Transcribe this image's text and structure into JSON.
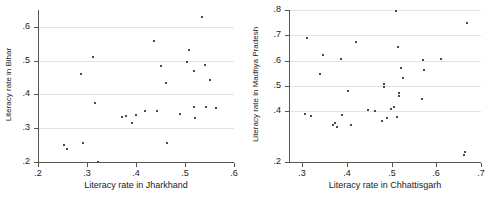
{
  "chart_data": [
    {
      "id": "left",
      "type": "scatter",
      "title": "",
      "xlabel": "Literacy rate in Jharkhand",
      "ylabel": "Literacy rate in Bihar",
      "xlim": [
        0.2,
        0.6
      ],
      "ylim": [
        0.2,
        0.65
      ],
      "xticks": [
        0.2,
        0.3,
        0.4,
        0.5,
        0.6
      ],
      "xticklabels": [
        ".2",
        ".3",
        ".4",
        ".5",
        ".6"
      ],
      "yticks": [
        0.2,
        0.3,
        0.4,
        0.5,
        0.6
      ],
      "yticklabels": [
        ".2",
        ".3",
        ".4",
        ".5",
        ".6"
      ],
      "gridlines": [
        0.2,
        0.3,
        0.4,
        0.5,
        0.6
      ],
      "grid": true,
      "legend": "none",
      "marker": "square",
      "marker_color": "#4a4a4a",
      "points": [
        {
          "x": 0.253,
          "y": 0.25
        },
        {
          "x": 0.26,
          "y": 0.239
        },
        {
          "x": 0.287,
          "y": 0.462
        },
        {
          "x": 0.291,
          "y": 0.255
        },
        {
          "x": 0.312,
          "y": 0.511
        },
        {
          "x": 0.316,
          "y": 0.374
        },
        {
          "x": 0.322,
          "y": 0.2
        },
        {
          "x": 0.371,
          "y": 0.333
        },
        {
          "x": 0.379,
          "y": 0.336
        },
        {
          "x": 0.392,
          "y": 0.316
        },
        {
          "x": 0.401,
          "y": 0.338
        },
        {
          "x": 0.418,
          "y": 0.35
        },
        {
          "x": 0.437,
          "y": 0.559
        },
        {
          "x": 0.443,
          "y": 0.35
        },
        {
          "x": 0.452,
          "y": 0.485
        },
        {
          "x": 0.461,
          "y": 0.433
        },
        {
          "x": 0.464,
          "y": 0.257
        },
        {
          "x": 0.49,
          "y": 0.342
        },
        {
          "x": 0.505,
          "y": 0.496
        },
        {
          "x": 0.509,
          "y": 0.531
        },
        {
          "x": 0.518,
          "y": 0.468
        },
        {
          "x": 0.519,
          "y": 0.364
        },
        {
          "x": 0.521,
          "y": 0.329
        },
        {
          "x": 0.534,
          "y": 0.628
        },
        {
          "x": 0.541,
          "y": 0.486
        },
        {
          "x": 0.543,
          "y": 0.364
        },
        {
          "x": 0.551,
          "y": 0.442
        },
        {
          "x": 0.563,
          "y": 0.36
        }
      ]
    },
    {
      "id": "right",
      "type": "scatter",
      "title": "",
      "xlabel": "Literacy rate in Chhattisgarh",
      "ylabel": "Literacy rate in Madhya Pradesh",
      "xlim": [
        0.27,
        0.7
      ],
      "ylim": [
        0.2,
        0.8
      ],
      "xticks": [
        0.3,
        0.4,
        0.5,
        0.6,
        0.7
      ],
      "xticklabels": [
        ".3",
        ".4",
        ".5",
        ".6",
        ".7"
      ],
      "yticks": [
        0.2,
        0.4,
        0.5,
        0.6,
        0.7,
        0.8
      ],
      "yticklabels": [
        ".2",
        ".4",
        ".5",
        ".6",
        ".7",
        ".8"
      ],
      "gridlines": [
        0.2,
        0.4,
        0.5,
        0.6,
        0.7,
        0.8
      ],
      "grid": true,
      "legend": "none",
      "marker": "square",
      "marker_color": "#4a4a4a",
      "points": [
        {
          "x": 0.305,
          "y": 0.388
        },
        {
          "x": 0.31,
          "y": 0.69
        },
        {
          "x": 0.32,
          "y": 0.383
        },
        {
          "x": 0.34,
          "y": 0.546
        },
        {
          "x": 0.347,
          "y": 0.623
        },
        {
          "x": 0.368,
          "y": 0.347
        },
        {
          "x": 0.374,
          "y": 0.352
        },
        {
          "x": 0.378,
          "y": 0.34
        },
        {
          "x": 0.386,
          "y": 0.605
        },
        {
          "x": 0.389,
          "y": 0.384
        },
        {
          "x": 0.403,
          "y": 0.479
        },
        {
          "x": 0.409,
          "y": 0.347
        },
        {
          "x": 0.421,
          "y": 0.674
        },
        {
          "x": 0.447,
          "y": 0.404
        },
        {
          "x": 0.462,
          "y": 0.402
        },
        {
          "x": 0.478,
          "y": 0.361
        },
        {
          "x": 0.482,
          "y": 0.497
        },
        {
          "x": 0.482,
          "y": 0.508
        },
        {
          "x": 0.489,
          "y": 0.374
        },
        {
          "x": 0.498,
          "y": 0.41
        },
        {
          "x": 0.505,
          "y": 0.418
        },
        {
          "x": 0.509,
          "y": 0.795
        },
        {
          "x": 0.511,
          "y": 0.378
        },
        {
          "x": 0.513,
          "y": 0.655
        },
        {
          "x": 0.516,
          "y": 0.459
        },
        {
          "x": 0.517,
          "y": 0.471
        },
        {
          "x": 0.521,
          "y": 0.571
        },
        {
          "x": 0.525,
          "y": 0.532
        },
        {
          "x": 0.567,
          "y": 0.45
        },
        {
          "x": 0.57,
          "y": 0.604
        },
        {
          "x": 0.572,
          "y": 0.562
        },
        {
          "x": 0.611,
          "y": 0.608
        },
        {
          "x": 0.663,
          "y": 0.228
        },
        {
          "x": 0.665,
          "y": 0.24
        },
        {
          "x": 0.668,
          "y": 0.748
        }
      ]
    }
  ]
}
